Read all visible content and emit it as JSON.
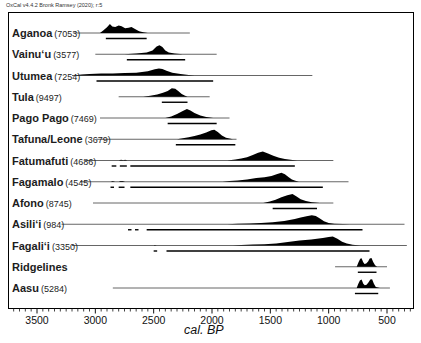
{
  "header": {
    "text": "OxCal v4.4.2 Bronk Ramsey (2020); r:5"
  },
  "chart_data": {
    "type": "area",
    "subtype": "oxcal-multiplot-calibrated-radiocarbon-distributions",
    "title": "",
    "xlabel": "cal. BP",
    "x_axis_reversed": true,
    "x_range_px_bp": [
      3750,
      280
    ],
    "x_tick_values": [
      3500,
      3000,
      2500,
      2000,
      1500,
      1000,
      500
    ],
    "x_tick_labels": [
      "3500",
      "3000",
      "2500",
      "2000",
      "1500",
      "1000",
      "500"
    ],
    "minor_tick_step_years": 50,
    "grid": false,
    "colors": {
      "curve_fill": "#000000",
      "baseline": "#555555",
      "range_bar": "#000000",
      "frame": "#000000"
    },
    "rows": [
      {
        "name": "Aganoa",
        "num": "(7053)",
        "line": [
          3190,
          2190
        ],
        "curve": [
          [
            2960,
            0
          ],
          [
            2930,
            0.28
          ],
          [
            2900,
            0.6
          ],
          [
            2875,
            0.95
          ],
          [
            2855,
            0.7
          ],
          [
            2830,
            0.62
          ],
          [
            2800,
            0.8
          ],
          [
            2775,
            0.72
          ],
          [
            2745,
            0.5
          ],
          [
            2715,
            0.55
          ],
          [
            2690,
            0.62
          ],
          [
            2660,
            0.42
          ],
          [
            2625,
            0.18
          ],
          [
            2590,
            0.08
          ],
          [
            2550,
            0
          ]
        ],
        "range": [
          [
            2910,
            2560
          ]
        ]
      },
      {
        "name": "Vainuʻu",
        "num": "(3577)",
        "line": [
          3000,
          1960
        ],
        "curve": [
          [
            2750,
            0
          ],
          [
            2650,
            0.08
          ],
          [
            2560,
            0.18
          ],
          [
            2510,
            0.4
          ],
          [
            2475,
            0.8
          ],
          [
            2450,
            0.95
          ],
          [
            2425,
            0.75
          ],
          [
            2400,
            0.4
          ],
          [
            2370,
            0.18
          ],
          [
            2320,
            0.08
          ],
          [
            2250,
            0
          ]
        ],
        "range": [
          [
            2730,
            2230
          ]
        ]
      },
      {
        "name": "Utumea",
        "num": "(7254)",
        "line": [
          3200,
          1140
        ],
        "curve": [
          [
            3180,
            0
          ],
          [
            3120,
            0.12
          ],
          [
            3050,
            0.17
          ],
          [
            2950,
            0.2
          ],
          [
            2850,
            0.22
          ],
          [
            2750,
            0.25
          ],
          [
            2650,
            0.3
          ],
          [
            2550,
            0.45
          ],
          [
            2490,
            0.65
          ],
          [
            2455,
            0.75
          ],
          [
            2425,
            0.68
          ],
          [
            2390,
            0.5
          ],
          [
            2340,
            0.3
          ],
          [
            2270,
            0.15
          ],
          [
            2200,
            0.06
          ],
          [
            2150,
            0
          ]
        ],
        "range": [
          [
            2990,
            1990
          ]
        ]
      },
      {
        "name": "Tula",
        "num": "(9497)",
        "line": [
          2800,
          2020
        ],
        "curve": [
          [
            2590,
            0
          ],
          [
            2530,
            0.1
          ],
          [
            2470,
            0.25
          ],
          [
            2420,
            0.42
          ],
          [
            2380,
            0.6
          ],
          [
            2345,
            0.9
          ],
          [
            2315,
            0.85
          ],
          [
            2290,
            0.6
          ],
          [
            2260,
            0.3
          ],
          [
            2235,
            0.12
          ],
          [
            2210,
            0
          ]
        ],
        "range": [
          [
            2430,
            2210
          ]
        ]
      },
      {
        "name": "Pago Pago",
        "num": "(7469)",
        "line": [
          2960,
          1850
        ],
        "curve": [
          [
            2400,
            0
          ],
          [
            2350,
            0.15
          ],
          [
            2300,
            0.42
          ],
          [
            2255,
            0.72
          ],
          [
            2215,
            0.95
          ],
          [
            2185,
            0.8
          ],
          [
            2150,
            0.52
          ],
          [
            2100,
            0.25
          ],
          [
            2050,
            0.1
          ],
          [
            1990,
            0
          ]
        ],
        "range": [
          [
            2380,
            1960
          ]
        ]
      },
      {
        "name": "Tafuna/Leone",
        "num": "(3679)",
        "line": [
          2990,
          1790
        ],
        "curve": [
          [
            2300,
            0
          ],
          [
            2250,
            0.1
          ],
          [
            2200,
            0.22
          ],
          [
            2150,
            0.35
          ],
          [
            2100,
            0.5
          ],
          [
            2050,
            0.72
          ],
          [
            2005,
            0.95
          ],
          [
            1980,
            1.0
          ],
          [
            1950,
            0.75
          ],
          [
            1915,
            0.4
          ],
          [
            1880,
            0.15
          ],
          [
            1820,
            0
          ]
        ],
        "range": [
          [
            2310,
            1800
          ]
        ]
      },
      {
        "name": "Fatumafuti",
        "num": "(4686)",
        "line": [
          3090,
          960
        ],
        "curve": [
          [
            2800,
            0
          ],
          [
            2780,
            0.07
          ],
          [
            2760,
            0.02
          ],
          [
            2745,
            0.08
          ],
          [
            2725,
            0
          ],
          [
            1870,
            0
          ],
          [
            1800,
            0.1
          ],
          [
            1750,
            0.2
          ],
          [
            1700,
            0.35
          ],
          [
            1650,
            0.58
          ],
          [
            1605,
            0.82
          ],
          [
            1565,
            0.95
          ],
          [
            1520,
            0.75
          ],
          [
            1475,
            0.5
          ],
          [
            1425,
            0.3
          ],
          [
            1375,
            0.15
          ],
          [
            1310,
            0.05
          ],
          [
            1270,
            0
          ]
        ],
        "range": [
          [
            2860,
            2820
          ],
          [
            2790,
            2730
          ],
          [
            2700,
            1290
          ]
        ]
      },
      {
        "name": "Fagamalo",
        "num": "(4545)",
        "line": [
          3130,
          830
        ],
        "curve": [
          [
            2870,
            0
          ],
          [
            2850,
            0.07
          ],
          [
            2830,
            0
          ],
          [
            2800,
            0
          ],
          [
            2785,
            0.08
          ],
          [
            2765,
            0.07
          ],
          [
            2745,
            0
          ],
          [
            1910,
            0
          ],
          [
            1850,
            0.08
          ],
          [
            1780,
            0.13
          ],
          [
            1700,
            0.25
          ],
          [
            1620,
            0.38
          ],
          [
            1550,
            0.48
          ],
          [
            1490,
            0.6
          ],
          [
            1440,
            0.82
          ],
          [
            1405,
            0.95
          ],
          [
            1375,
            0.78
          ],
          [
            1345,
            0.5
          ],
          [
            1315,
            0.25
          ],
          [
            1285,
            0.1
          ],
          [
            1255,
            0
          ]
        ],
        "range": [
          [
            2870,
            2840
          ],
          [
            2800,
            2750
          ],
          [
            2700,
            1050
          ]
        ]
      },
      {
        "name": "Afono",
        "num": "(8745)",
        "line": [
          3020,
          960
        ],
        "curve": [
          [
            1560,
            0
          ],
          [
            1505,
            0.15
          ],
          [
            1455,
            0.35
          ],
          [
            1405,
            0.6
          ],
          [
            1355,
            0.82
          ],
          [
            1310,
            0.95
          ],
          [
            1275,
            0.68
          ],
          [
            1240,
            0.4
          ],
          [
            1195,
            0.2
          ],
          [
            1145,
            0.08
          ],
          [
            1075,
            0
          ]
        ],
        "range": [
          [
            1480,
            1100
          ]
        ]
      },
      {
        "name": "Asiliʻi",
        "num": "(984)",
        "line": [
          3290,
          350
        ],
        "curve": [
          [
            1870,
            0
          ],
          [
            1780,
            0.05
          ],
          [
            1680,
            0.08
          ],
          [
            1580,
            0.12
          ],
          [
            1480,
            0.2
          ],
          [
            1380,
            0.35
          ],
          [
            1290,
            0.55
          ],
          [
            1240,
            0.7
          ],
          [
            1190,
            0.85
          ],
          [
            1145,
            0.95
          ],
          [
            1110,
            0.88
          ],
          [
            1075,
            0.6
          ],
          [
            1040,
            0.32
          ],
          [
            1000,
            0.14
          ],
          [
            950,
            0.05
          ],
          [
            880,
            0.02
          ],
          [
            820,
            0
          ]
        ],
        "range": [
          [
            2720,
            2690
          ],
          [
            2660,
            2630
          ],
          [
            2560,
            710
          ]
        ]
      },
      {
        "name": "Fagaliʻi",
        "num": "(3350)",
        "line": [
          3200,
          330
        ],
        "curve": [
          [
            2500,
            0
          ],
          [
            2490,
            0.05
          ],
          [
            2475,
            0
          ],
          [
            1820,
            0
          ],
          [
            1750,
            0.05
          ],
          [
            1650,
            0.09
          ],
          [
            1550,
            0.14
          ],
          [
            1450,
            0.22
          ],
          [
            1350,
            0.38
          ],
          [
            1250,
            0.52
          ],
          [
            1150,
            0.62
          ],
          [
            1050,
            0.78
          ],
          [
            1000,
            0.88
          ],
          [
            965,
            0.95
          ],
          [
            925,
            0.7
          ],
          [
            885,
            0.4
          ],
          [
            845,
            0.2
          ],
          [
            795,
            0.08
          ],
          [
            730,
            0
          ]
        ],
        "range": [
          [
            2500,
            2470
          ],
          [
            2390,
            650
          ]
        ]
      },
      {
        "name": "Ridgelines",
        "num": "",
        "line": [
          945,
          500
        ],
        "curve": [
          [
            760,
            0
          ],
          [
            745,
            0.45
          ],
          [
            730,
            0.85
          ],
          [
            718,
            0.9
          ],
          [
            705,
            0.5
          ],
          [
            693,
            0.3
          ],
          [
            678,
            0.35
          ],
          [
            662,
            0.55
          ],
          [
            648,
            0.88
          ],
          [
            633,
            0.92
          ],
          [
            618,
            0.5
          ],
          [
            602,
            0.15
          ],
          [
            585,
            0
          ]
        ],
        "range": [
          [
            750,
            590
          ]
        ]
      },
      {
        "name": "Aasu",
        "num": "(5284)",
        "line": [
          2850,
          475
        ],
        "curve": [
          [
            760,
            0
          ],
          [
            748,
            0.4
          ],
          [
            732,
            0.8
          ],
          [
            718,
            0.88
          ],
          [
            703,
            0.45
          ],
          [
            690,
            0.28
          ],
          [
            675,
            0.35
          ],
          [
            658,
            0.6
          ],
          [
            643,
            0.9
          ],
          [
            628,
            0.92
          ],
          [
            612,
            0.45
          ],
          [
            596,
            0.12
          ],
          [
            560,
            0
          ]
        ],
        "range": [
          [
            775,
            575
          ]
        ]
      }
    ]
  }
}
